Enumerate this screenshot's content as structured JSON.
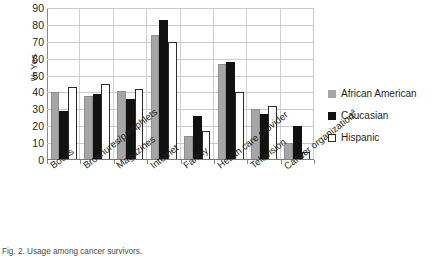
{
  "chart_data": {
    "type": "bar",
    "title": "",
    "xlabel": "",
    "ylabel": "% Yes",
    "ylim": [
      0,
      90
    ],
    "ytick_step": 10,
    "yticks": [
      90,
      80,
      70,
      60,
      50,
      40,
      30,
      20,
      10,
      0
    ],
    "grid": true,
    "legend_position": "right",
    "categories": [
      "Books",
      "Brochures/pamphlets",
      "Magazines",
      "Internet",
      "Family",
      "Health care provider",
      "Television",
      "Cancer organization"
    ],
    "category_footnote_marker": "a",
    "category_with_footnote": "Cancer organization",
    "series": [
      {
        "name": "African American",
        "color": "#A6A6A6",
        "values": [
          40,
          38,
          41,
          74,
          14,
          57,
          30,
          10
        ]
      },
      {
        "name": "Caucasian",
        "color": "#111111",
        "values": [
          29,
          39,
          36,
          83,
          26,
          58,
          27,
          20
        ]
      },
      {
        "name": "Hispanic",
        "color": "#FFFFFF",
        "values": [
          43,
          45,
          42,
          70,
          17,
          40,
          32,
          5
        ]
      }
    ]
  },
  "legend": {
    "items": [
      {
        "label": "African American"
      },
      {
        "label": "Caucasian"
      },
      {
        "label": "Hispanic"
      }
    ]
  },
  "caption": {
    "text": "Fig. 2. Usage among cancer survivors."
  }
}
